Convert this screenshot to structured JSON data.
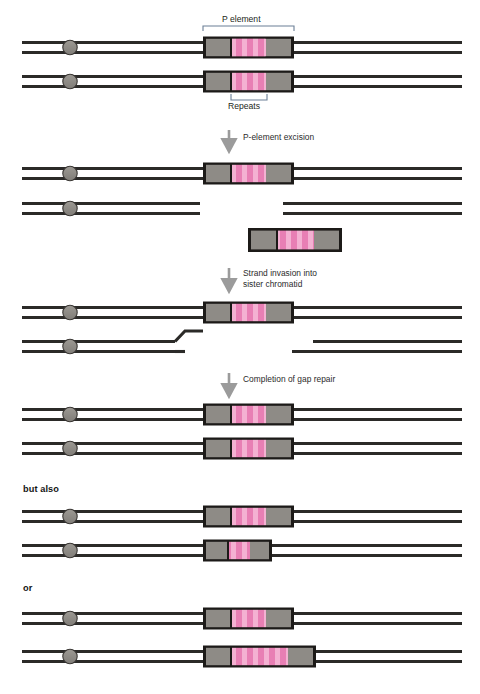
{
  "figure": {
    "background_color": "#ffffff",
    "strand_color": "#2b2a28",
    "centromere_color": "#8e8b86",
    "centromere_stroke": "#3a3734",
    "element_border_color": "#1c1a18",
    "element_end_color": "#8e8b86",
    "repeat_color_base": "#e87fb4",
    "repeat_color_stripe": "#f3a9cd",
    "bracket_color": "#6b7f96",
    "arrow_color": "#9b9b9b"
  },
  "labels": {
    "p_element": "P element",
    "repeats": "Repeats",
    "but_also": "but also",
    "or": "or"
  },
  "steps": [
    {
      "id": "excision",
      "text": "P-element excision"
    },
    {
      "id": "strand-invasion",
      "text": "Strand invasion into\nsister chromatid"
    },
    {
      "id": "gap-repair",
      "text": "Completion of gap repair"
    }
  ],
  "step_lines": {
    "excision": [
      "P-element excision"
    ],
    "strand_invasion": [
      "Strand invasion into",
      "sister chromatid"
    ],
    "gap_repair": [
      "Completion of gap repair"
    ]
  },
  "panels": [
    {
      "id": "panel-initial",
      "name": "initial-sister-chromatids",
      "rows": [
        {
          "id": "row-1",
          "repeats": 8,
          "element_width": 90,
          "broken": false
        },
        {
          "id": "row-2",
          "repeats": 8,
          "element_width": 90,
          "broken": false
        }
      ]
    },
    {
      "id": "panel-excised",
      "name": "after-excision",
      "rows": [
        {
          "id": "row-1",
          "repeats": 8,
          "element_width": 90,
          "broken": false
        },
        {
          "id": "row-2",
          "repeats": 0,
          "element_width": 0,
          "broken": true
        },
        {
          "id": "free-element",
          "repeats": 7,
          "element_width": 88,
          "broken": false
        }
      ]
    },
    {
      "id": "panel-invasion",
      "name": "strand-invasion",
      "rows": [
        {
          "id": "row-1",
          "repeats": 8,
          "element_width": 90,
          "broken": false
        },
        {
          "id": "row-2",
          "repeats": 0,
          "element_width": 0,
          "broken": true,
          "invading_strand": true
        }
      ]
    },
    {
      "id": "panel-repaired",
      "name": "gap-repair-complete",
      "rows": [
        {
          "id": "row-1",
          "repeats": 8,
          "element_width": 90,
          "broken": false
        },
        {
          "id": "row-2",
          "repeats": 8,
          "element_width": 90,
          "broken": false
        }
      ]
    },
    {
      "id": "panel-but-also",
      "name": "alternative-outcome-partial",
      "rows": [
        {
          "id": "row-1",
          "repeats": 8,
          "element_width": 90,
          "broken": false
        },
        {
          "id": "row-2",
          "repeats": 5,
          "element_width": 64,
          "broken": false
        }
      ]
    },
    {
      "id": "panel-or",
      "name": "alternative-outcome-expanded",
      "rows": [
        {
          "id": "row-1",
          "repeats": 8,
          "element_width": 90,
          "broken": false
        },
        {
          "id": "row-2",
          "repeats": 11,
          "element_width": 112,
          "broken": false
        }
      ]
    }
  ]
}
